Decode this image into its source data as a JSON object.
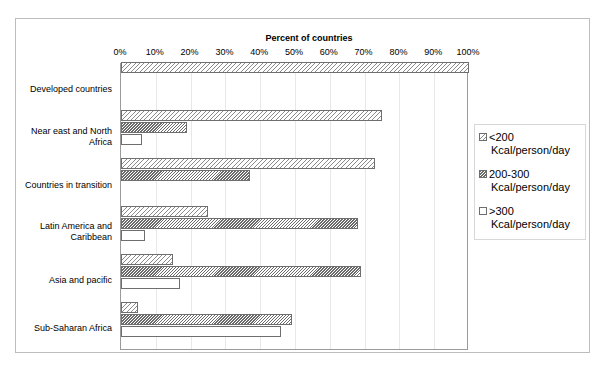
{
  "chart_data": {
    "type": "bar",
    "orientation": "horizontal",
    "grouped": true,
    "title": "",
    "xlabel": "Percent of countries",
    "ylabel": "",
    "xlim": [
      0,
      100
    ],
    "xticks": [
      "0%",
      "10%",
      "20%",
      "30%",
      "40%",
      "50%",
      "60%",
      "70%",
      "80%",
      "90%",
      "100%"
    ],
    "xtick_values": [
      0,
      10,
      20,
      30,
      40,
      50,
      60,
      70,
      80,
      90,
      100
    ],
    "grid": "vertical",
    "legend_position": "right",
    "categories": [
      "Developed countries",
      "Near east and North Africa",
      "Countries in transition",
      "Latin America and Caribbean",
      "Asia and pacific",
      "Sub-Saharan Africa"
    ],
    "series": [
      {
        "name": "<200 Kcal/person/day",
        "pattern": "sparse-diagonal-hatch",
        "values": [
          100,
          75,
          73,
          25,
          15,
          5
        ]
      },
      {
        "name": "200-300 Kcal/person/day",
        "pattern": "dense-diagonal-hatch",
        "values": [
          0,
          19,
          37,
          68,
          69,
          49
        ]
      },
      {
        "name": ">300 Kcal/person/day",
        "pattern": "dotted-white",
        "values": [
          0,
          6,
          0,
          7,
          17,
          46
        ]
      }
    ]
  },
  "legend": {
    "items": [
      {
        "line1": "<200",
        "line2": "Kcal/person/day"
      },
      {
        "line1": "200-300",
        "line2": "Kcal/person/day"
      },
      {
        "line1": ">300",
        "line2": "Kcal/person/day"
      }
    ]
  },
  "colors": {
    "frame": "#bdbdbd",
    "plot_border": "#9a9a9a",
    "gridline": "#e8e8e8",
    "bar_border": "#6e6e6e",
    "hatch": "#8a8a8a",
    "background": "#ffffff"
  }
}
